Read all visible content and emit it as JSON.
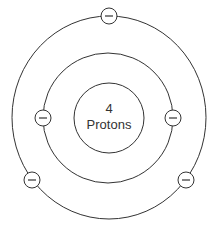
{
  "diagram": {
    "nucleus": {
      "line1": "4",
      "line2": "Protons"
    },
    "electron_symbol": "minus-icon",
    "shells": [
      {
        "name": "inner",
        "electrons": 2
      },
      {
        "name": "outer",
        "electrons": 3
      }
    ],
    "colors": {
      "stroke": "#333333",
      "background": "#ffffff"
    }
  }
}
